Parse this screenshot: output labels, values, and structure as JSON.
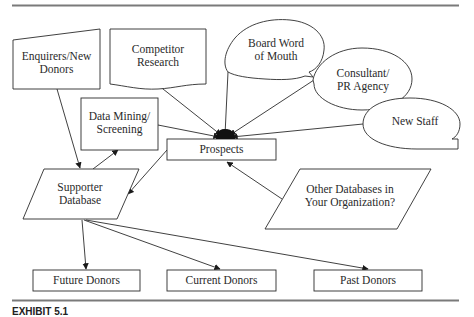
{
  "diagram": {
    "nodes": {
      "enquirers": {
        "label": "Enquirers/New\nDonors",
        "shape": "manual-input"
      },
      "competitor": {
        "label": "Competitor\nResearch",
        "shape": "document"
      },
      "board": {
        "label": "Board Word\nof Mouth",
        "shape": "callout-ellipse"
      },
      "consultant": {
        "label": "Consultant/\nPR Agency",
        "shape": "callout-ellipse"
      },
      "new_staff": {
        "label": "New Staff",
        "shape": "callout-ellipse"
      },
      "data_mining": {
        "label": "Data Mining/\nScreening",
        "shape": "rectangle"
      },
      "prospects": {
        "label": "Prospects",
        "shape": "rectangle"
      },
      "supporter_db": {
        "label": "Supporter\nDatabase",
        "shape": "parallelogram"
      },
      "other_db": {
        "label": "Other Databases in\nYour Organization?",
        "shape": "parallelogram"
      },
      "future": {
        "label": "Future Donors",
        "shape": "rectangle"
      },
      "current": {
        "label": "Current Donors",
        "shape": "rectangle"
      },
      "past": {
        "label": "Past Donors",
        "shape": "rectangle"
      }
    },
    "edges": [
      {
        "from": "competitor",
        "to": "prospects"
      },
      {
        "from": "board",
        "to": "prospects"
      },
      {
        "from": "consultant",
        "to": "prospects"
      },
      {
        "from": "new_staff",
        "to": "prospects"
      },
      {
        "from": "data_mining",
        "to": "prospects"
      },
      {
        "from": "other_db",
        "to": "prospects"
      },
      {
        "from": "enquirers",
        "to": "supporter_db"
      },
      {
        "from": "prospects",
        "to": "supporter_db"
      },
      {
        "from": "supporter_db",
        "to": "data_mining"
      },
      {
        "from": "supporter_db",
        "to": "future"
      },
      {
        "from": "supporter_db",
        "to": "current"
      },
      {
        "from": "supporter_db",
        "to": "past"
      }
    ],
    "colors": {
      "stroke": "#2b2b2b",
      "rule": "#7a7a7a",
      "text": "#2a2a2a"
    }
  },
  "caption": {
    "lead": "EXHIBIT 5.1",
    "text": ""
  }
}
